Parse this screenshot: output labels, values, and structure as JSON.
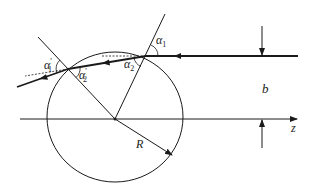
{
  "diagram": {
    "type": "ray-through-sphere",
    "colors": {
      "stroke": "#1a1a1a",
      "background": "#ffffff"
    },
    "sphere": {
      "center": [
        115,
        118
      ],
      "rx": 68,
      "ry": 66
    },
    "axis_label": "z",
    "impact_parameter_label": "b",
    "radius_label": "R",
    "angles": {
      "alpha1": {
        "sym": "α",
        "sub": "1",
        "sup": ""
      },
      "alpha2": {
        "sym": "α",
        "sub": "2",
        "sup": ""
      },
      "alpha1_prime": {
        "sym": "α",
        "sub": "1",
        "sup": "′"
      },
      "alpha2_prime": {
        "sym": "α",
        "sub": "2",
        "sup": "′"
      }
    }
  }
}
